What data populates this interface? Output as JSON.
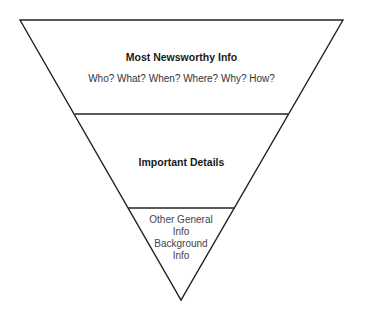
{
  "diagram": {
    "type": "inverted-pyramid",
    "colors": {
      "stroke": "#222222",
      "background": "#ffffff",
      "text": "#222222"
    },
    "tiers": [
      {
        "title": "Most Newsworthy Info",
        "subtitle": "Who? What? When? Where? Why? How?"
      },
      {
        "title": "Important Details"
      },
      {
        "lines": [
          "Other General",
          "Info",
          "Background",
          "Info"
        ]
      }
    ]
  }
}
